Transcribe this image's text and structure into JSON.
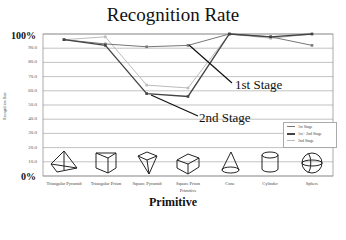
{
  "chart_data": {
    "type": "line",
    "title": "Recognition Rate",
    "xlabel": "Primitive",
    "ylabel": "Recognition Rate",
    "ylim": [
      0,
      100
    ],
    "y_ticks": [
      "0%",
      "10.0",
      "20.0",
      "30.0",
      "40.0",
      "50.0",
      "60.0",
      "70.0",
      "80.0",
      "90.0",
      "100%"
    ],
    "categories": [
      "Triangular Pyramid",
      "Triangular Prism",
      "Square Pyramid",
      "Square Prism",
      "Cone",
      "Cylinder",
      "Sphere"
    ],
    "x_sublabel": "Primitive",
    "series": [
      {
        "name": "1st Stage",
        "color": "#777777",
        "values": [
          96,
          93,
          91,
          92,
          100,
          98,
          92
        ]
      },
      {
        "name": "1st+ 2nd Stage",
        "color": "#444444",
        "values": [
          96,
          92,
          58,
          56,
          100,
          98,
          100
        ]
      },
      {
        "name": "2nd Stage",
        "color": "#bbbbbb",
        "values": [
          96,
          98,
          64,
          62,
          100,
          97,
          100
        ]
      }
    ],
    "annotations": [
      {
        "text": "1st Stage",
        "points_to": "Square Prism, 1st Stage"
      },
      {
        "text": "2nd Stage",
        "points_to": "Square Pyramid, 1st+ 2nd Stage"
      }
    ],
    "legend_position": "lower right inside plot",
    "grid": true,
    "category_icons": [
      "triangular-pyramid",
      "triangular-prism",
      "square-pyramid",
      "square-prism",
      "cone",
      "cylinder",
      "sphere"
    ]
  }
}
